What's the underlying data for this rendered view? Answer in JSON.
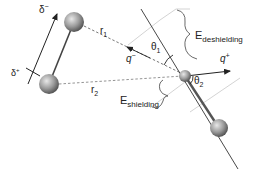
{
  "diagram": {
    "labels": {
      "delta_minus": "δ",
      "delta_minus_sup": "−",
      "delta_plus": "δ",
      "delta_plus_sup": "+",
      "r1": "r",
      "r1_sub": "1",
      "r2": "r",
      "r2_sub": "2",
      "q_minus": "q",
      "q_minus_sup": "−",
      "q_plus": "q",
      "q_plus_sup": "+",
      "theta1": "θ",
      "theta1_sub": "1",
      "theta2": "θ",
      "theta2_sub": "2",
      "e_deshielding": "E",
      "e_deshielding_sub": "deshielding",
      "e_shielding": "E",
      "e_shielding_sub": "shielding"
    },
    "colors": {
      "line": "#333333",
      "dashed": "#777777",
      "guide": "#cccccc",
      "sphere_light": "#d8d8d8",
      "sphere_dark": "#555555"
    }
  }
}
